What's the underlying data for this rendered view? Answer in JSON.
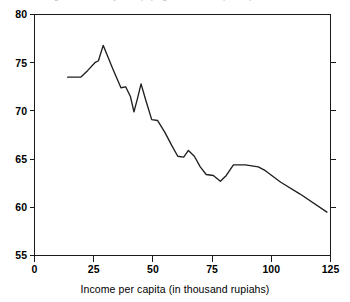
{
  "figure": {
    "clipped_top_text": "Figure 2. Poverty rate (%) against income per capita",
    "xaxis_title": "Income per capita (in thousand rupiahs)",
    "yaxis_title": ""
  },
  "chart_data": {
    "type": "line",
    "title": "",
    "xlabel": "Income per capita (in thousand rupiahs)",
    "ylabel": "",
    "xlim": [
      0,
      125
    ],
    "ylim": [
      55,
      80
    ],
    "xticks": [
      0,
      25,
      50,
      75,
      100,
      125
    ],
    "yticks": [
      55,
      60,
      65,
      70,
      75,
      80
    ],
    "xtick_labels": [
      "0",
      "25",
      "50",
      "75",
      "100",
      "125"
    ],
    "ytick_labels": [
      "55",
      "60",
      "65",
      "70",
      "75",
      "80"
    ],
    "grid": false,
    "legend": null,
    "series": [
      {
        "name": "series-1",
        "x": [
          14.0,
          19.5,
          22.5,
          25.5,
          27.0,
          29.0,
          33.0,
          36.5,
          38.5,
          40.5,
          42.0,
          43.5,
          45.0,
          47.0,
          49.5,
          52.0,
          55.0,
          58.0,
          60.5,
          63.0,
          65.0,
          67.5,
          70.0,
          72.5,
          75.5,
          78.5,
          81.0,
          84.0,
          89.0,
          94.5,
          97.5,
          104.0,
          112.0,
          123.5
        ],
        "y": [
          73.5,
          73.5,
          74.2,
          75.0,
          75.2,
          76.8,
          74.4,
          72.4,
          72.5,
          71.5,
          69.9,
          71.3,
          72.8,
          71.1,
          69.1,
          69.0,
          67.8,
          66.4,
          65.3,
          65.2,
          65.9,
          65.3,
          64.2,
          63.4,
          63.3,
          62.7,
          63.3,
          64.4,
          64.4,
          64.2,
          63.8,
          62.6,
          61.4,
          59.5
        ]
      }
    ]
  },
  "ticks": {
    "x": [
      "0",
      "25",
      "50",
      "75",
      "100",
      "125"
    ],
    "y": [
      "55",
      "60",
      "65",
      "70",
      "75",
      "80"
    ]
  }
}
